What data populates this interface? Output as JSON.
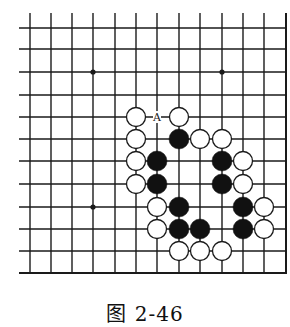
{
  "figure": {
    "caption": "图 2-46",
    "type": "go-board-diagram"
  },
  "board": {
    "columns": 13,
    "rows": 12,
    "col_x": [
      30,
      51,
      72,
      93,
      115,
      136,
      157,
      179,
      200,
      222,
      243,
      264,
      286
    ],
    "row_y": [
      28,
      49,
      72,
      95,
      117,
      139,
      161,
      184,
      207,
      229,
      251,
      273
    ],
    "line_color": "#1a1a1a",
    "edges": {
      "right": true,
      "bottom": true,
      "left": false,
      "top": false
    },
    "star_points": [
      [
        3,
        2
      ],
      [
        9,
        2
      ],
      [
        3,
        8
      ]
    ],
    "stone_radius": 9.5
  },
  "stones": {
    "black": [
      [
        7,
        5
      ],
      [
        6,
        6
      ],
      [
        9,
        6
      ],
      [
        6,
        7
      ],
      [
        9,
        7
      ],
      [
        7,
        8
      ],
      [
        10,
        8
      ],
      [
        7,
        9
      ],
      [
        8,
        9
      ],
      [
        10,
        9
      ]
    ],
    "white": [
      [
        5,
        4
      ],
      [
        7,
        4
      ],
      [
        5,
        5
      ],
      [
        8,
        5
      ],
      [
        9,
        5
      ],
      [
        5,
        6
      ],
      [
        10,
        6
      ],
      [
        5,
        7
      ],
      [
        10,
        7
      ],
      [
        6,
        8
      ],
      [
        11,
        8
      ],
      [
        6,
        9
      ],
      [
        11,
        9
      ],
      [
        7,
        10
      ],
      [
        8,
        10
      ],
      [
        9,
        10
      ]
    ]
  },
  "labels": [
    {
      "text": "A",
      "col": 6,
      "row": 4
    }
  ]
}
